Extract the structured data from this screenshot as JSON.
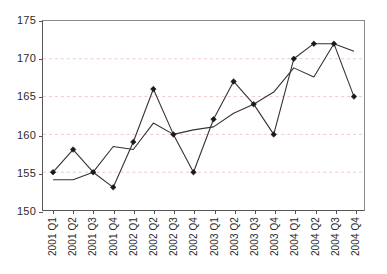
{
  "chart_data": {
    "type": "line",
    "title": "",
    "subtitle": "",
    "xlabel": "",
    "ylabel": "",
    "ylim": [
      150,
      175
    ],
    "yticks": [
      150,
      155,
      160,
      165,
      170,
      175
    ],
    "grid": true,
    "gridlines_at": [
      155,
      160,
      165,
      170
    ],
    "legend": "none",
    "legend_position": "none",
    "marker": "diamond",
    "line_color": "#333333",
    "marker_color": "#1a1a1a",
    "grid_color": "#f0c8c8",
    "axis_color": "#555555",
    "categories": [
      "2001 Q1",
      "2001 Q2",
      "2001 Q3",
      "2001 Q4",
      "2002 Q1",
      "2002 Q2",
      "2002 Q3",
      "2002 Q4",
      "2003 Q1",
      "2003 Q2",
      "2003 Q3",
      "2003 Q4",
      "2004 Q1",
      "2004 Q2",
      "2004 Q3",
      "2004 Q4"
    ],
    "series": [
      {
        "name": "Observed",
        "marker": "diamond",
        "values": [
          155,
          158,
          155,
          153,
          159,
          166,
          160,
          155,
          162,
          167,
          164,
          160,
          170,
          172,
          172,
          165
        ]
      },
      {
        "name": "Trend",
        "marker": "none",
        "values": [
          154,
          154,
          155,
          158.4,
          158,
          161.5,
          160,
          160.6,
          161,
          162.8,
          164,
          165.6,
          168.8,
          167.6,
          172,
          171
        ]
      }
    ]
  }
}
